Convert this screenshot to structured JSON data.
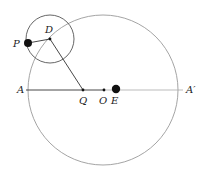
{
  "diagram": {
    "labels": {
      "A": "A",
      "A_prime": "A′",
      "Q": "Q",
      "O": "O",
      "E": "E",
      "D": "D",
      "P": "P"
    },
    "colors": {
      "line_dark": "#333333",
      "line_light": "#aaaaaa",
      "circle": "#999999",
      "point": "#111111"
    }
  }
}
